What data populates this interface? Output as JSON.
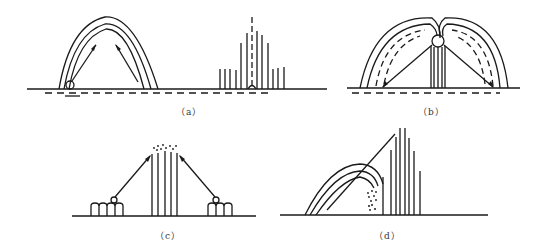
{
  "diagram": {
    "type": "illustration",
    "panels": [
      {
        "id": "a",
        "caption": "（a）",
        "description": "Arched paths from a point on ground with arrows, plus vertical bar fan around a dashed center axis"
      },
      {
        "id": "b",
        "caption": "（b）",
        "description": "Double arch fountain from central sphere on tower with arrows to ground"
      },
      {
        "id": "c",
        "caption": "（c）",
        "description": "Two ground sources with arrows converging to top of vertical bar cluster with scattered dots"
      },
      {
        "id": "d",
        "caption": "（d）",
        "description": "Curved arcs and diagonal line toward tall vertical bar cluster with scattered dots"
      }
    ]
  },
  "colors": {
    "stroke": "#1a1a1a",
    "background": "#ffffff"
  }
}
